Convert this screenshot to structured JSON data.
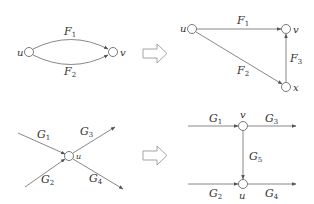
{
  "diagram": {
    "panels": [
      {
        "id": "top-left",
        "nodes": [
          "u",
          "v"
        ],
        "edges": [
          {
            "from": "u",
            "to": "v",
            "label": "F",
            "sub": "1"
          },
          {
            "from": "u",
            "to": "v",
            "label": "F",
            "sub": "2"
          }
        ]
      },
      {
        "id": "top-right",
        "nodes": [
          "u",
          "v",
          "x"
        ],
        "edges": [
          {
            "from": "u",
            "to": "v",
            "label": "F",
            "sub": "1"
          },
          {
            "from": "u",
            "to": "x",
            "label": "F",
            "sub": "2"
          },
          {
            "from": "x",
            "to": "v",
            "label": "F",
            "sub": "3"
          }
        ]
      },
      {
        "id": "bottom-left",
        "nodes": [
          "u"
        ],
        "edges": [
          {
            "to": "u",
            "label": "G",
            "sub": "1"
          },
          {
            "to": "u",
            "label": "G",
            "sub": "2"
          },
          {
            "from": "u",
            "label": "G",
            "sub": "3"
          },
          {
            "from": "u",
            "label": "G",
            "sub": "4"
          }
        ]
      },
      {
        "id": "bottom-right",
        "nodes": [
          "v",
          "u"
        ],
        "edges": [
          {
            "to": "v",
            "label": "G",
            "sub": "1"
          },
          {
            "from": "v",
            "label": "G",
            "sub": "3"
          },
          {
            "from": "v",
            "to": "u",
            "label": "G",
            "sub": "5"
          },
          {
            "to": "u",
            "label": "G",
            "sub": "2"
          },
          {
            "from": "u",
            "label": "G",
            "sub": "4"
          }
        ]
      }
    ],
    "transform_arrows": 2,
    "labels": {
      "u": "u",
      "v": "v",
      "x": "x",
      "F": "F",
      "G": "G",
      "s1": "1",
      "s2": "2",
      "s3": "3",
      "s4": "4",
      "s5": "5"
    }
  }
}
